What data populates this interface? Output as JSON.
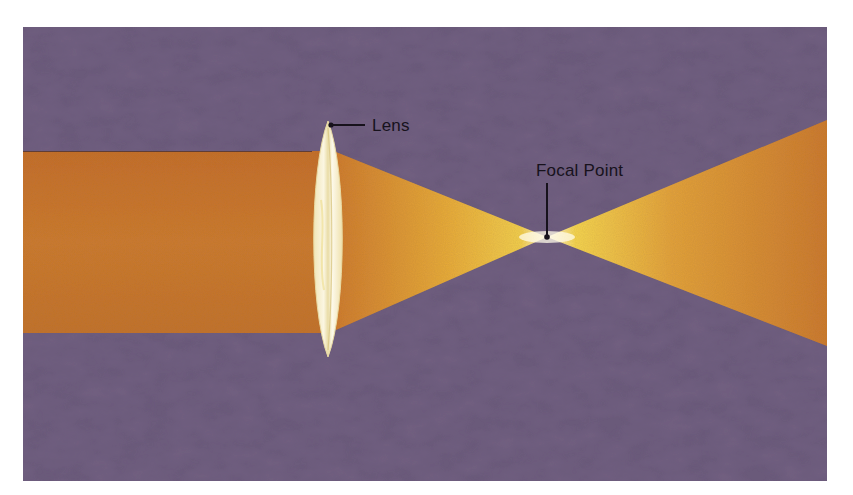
{
  "diagram": {
    "labels": {
      "lens": "Lens",
      "focal_point": "Focal Point"
    },
    "colors": {
      "background": "#6a5878",
      "background_dark": "#4f3f5c",
      "beam_incoming": "#c9742a",
      "beam_bright": "#f0c445",
      "beam_hot": "#fff6d6",
      "lens_fill": "#f5efd0",
      "ink": "#17121c"
    },
    "geometry": {
      "panel": {
        "x": 23,
        "y": 27,
        "width": 804,
        "height": 454
      },
      "incoming_beam": {
        "y_top": 151,
        "y_bottom": 333
      },
      "lens": {
        "center_x": 328,
        "top_y": 121,
        "bottom_y": 357,
        "half_width": 17
      },
      "focal_point": {
        "x": 547,
        "y": 237
      },
      "outgoing_beam_at_right_edge": {
        "y_top": 120,
        "y_bottom": 346
      }
    }
  }
}
